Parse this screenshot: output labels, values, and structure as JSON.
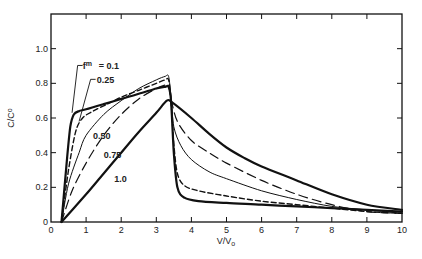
{
  "chart_data": {
    "type": "line",
    "title": "",
    "xlabel": "V/V",
    "xlabel_sub": "o",
    "ylabel": "C/C",
    "ylabel_sub": "o",
    "xlim": [
      0,
      10
    ],
    "ylim": [
      0,
      1.2
    ],
    "x_ticks": [
      0,
      1,
      2,
      3,
      4,
      5,
      6,
      7,
      8,
      9,
      10
    ],
    "x_tick_labels": [
      "0",
      "1",
      "2",
      "3",
      "4",
      "5",
      "6",
      "7",
      "8",
      "9",
      "10"
    ],
    "y_ticks": [
      0,
      0.2,
      0.4,
      0.6,
      0.8,
      1.0
    ],
    "y_tick_labels": [
      "0",
      "0.2",
      "0.4",
      "0.6",
      "0.8",
      "1.0"
    ],
    "grid": false,
    "legend_prefix": "f",
    "legend_prefix_sup": "m",
    "series": [
      {
        "name": "0.1",
        "label": "= 0.1",
        "style": "thick-solid",
        "x": [
          0.3,
          0.45,
          0.55,
          0.65,
          0.8,
          1.0,
          1.5,
          2.0,
          2.5,
          3.0,
          3.25,
          3.35,
          3.42,
          3.5,
          3.6,
          3.8,
          4.2,
          5.0,
          6.0,
          7.0,
          8.0,
          9.0,
          10.0
        ],
        "y": [
          0.0,
          0.35,
          0.55,
          0.62,
          0.64,
          0.65,
          0.68,
          0.71,
          0.74,
          0.77,
          0.78,
          0.78,
          0.7,
          0.4,
          0.2,
          0.14,
          0.12,
          0.11,
          0.1,
          0.09,
          0.08,
          0.07,
          0.06
        ]
      },
      {
        "name": "0.25",
        "label": "0.25",
        "style": "short-dash",
        "x": [
          0.3,
          0.5,
          0.7,
          0.9,
          1.2,
          1.6,
          2.0,
          2.5,
          3.0,
          3.25,
          3.35,
          3.42,
          3.5,
          3.6,
          3.8,
          4.2,
          5.0,
          6.0,
          7.0,
          8.0,
          9.0,
          10.0
        ],
        "y": [
          0.0,
          0.3,
          0.52,
          0.6,
          0.64,
          0.68,
          0.72,
          0.76,
          0.8,
          0.82,
          0.82,
          0.7,
          0.45,
          0.28,
          0.21,
          0.18,
          0.15,
          0.12,
          0.1,
          0.08,
          0.06,
          0.05
        ]
      },
      {
        "name": "0.50",
        "label": "0.50",
        "style": "thin-solid",
        "x": [
          0.3,
          0.5,
          0.8,
          1.0,
          1.5,
          2.0,
          2.5,
          3.0,
          3.25,
          3.35,
          3.42,
          3.5,
          3.7,
          4.0,
          4.5,
          5.0,
          6.0,
          7.0,
          8.0,
          9.0,
          10.0
        ],
        "y": [
          0.0,
          0.22,
          0.4,
          0.5,
          0.62,
          0.7,
          0.77,
          0.82,
          0.84,
          0.84,
          0.72,
          0.55,
          0.44,
          0.36,
          0.29,
          0.25,
          0.18,
          0.13,
          0.09,
          0.07,
          0.05
        ]
      },
      {
        "name": "0.75",
        "label": "0.75",
        "style": "long-dash",
        "x": [
          0.3,
          0.6,
          1.0,
          1.5,
          2.0,
          2.5,
          3.0,
          3.25,
          3.35,
          3.42,
          3.6,
          4.0,
          4.5,
          5.0,
          6.0,
          7.0,
          8.0,
          9.0,
          10.0
        ],
        "y": [
          0.0,
          0.18,
          0.34,
          0.5,
          0.62,
          0.71,
          0.77,
          0.79,
          0.79,
          0.71,
          0.58,
          0.47,
          0.4,
          0.34,
          0.24,
          0.16,
          0.1,
          0.06,
          0.05
        ]
      },
      {
        "name": "1.0",
        "label": "1.0",
        "style": "thick-solid",
        "x": [
          0.3,
          1.0,
          1.5,
          2.0,
          2.5,
          3.0,
          3.3,
          3.45,
          4.0,
          4.5,
          5.0,
          5.5,
          6.0,
          7.0,
          8.0,
          9.0,
          10.0
        ],
        "y": [
          0.0,
          0.16,
          0.28,
          0.4,
          0.52,
          0.63,
          0.7,
          0.69,
          0.6,
          0.51,
          0.43,
          0.37,
          0.32,
          0.24,
          0.16,
          0.1,
          0.07
        ]
      }
    ],
    "label_positions": {
      "0.1": [
        1.3,
        0.88
      ],
      "0.25": [
        1.3,
        0.8
      ],
      "0.50": [
        1.2,
        0.48
      ],
      "0.75": [
        1.5,
        0.37
      ],
      "1.0": [
        1.8,
        0.23
      ]
    }
  }
}
